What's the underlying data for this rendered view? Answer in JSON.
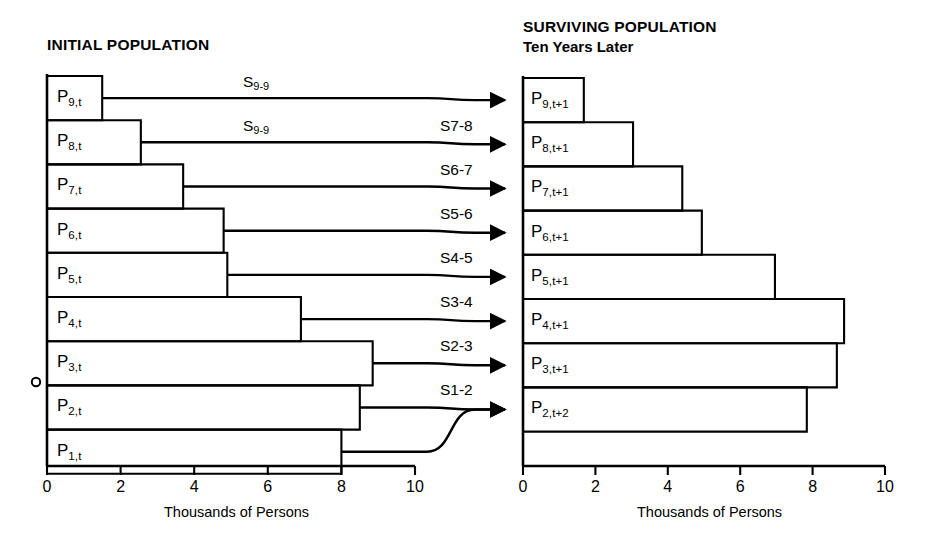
{
  "figure": {
    "type": "diagram"
  },
  "left_panel": {
    "title": "INITIAL POPULATION",
    "axis": {
      "label": "Thousands of Persons",
      "ticks": [
        "0",
        "2",
        "4",
        "6",
        "8",
        "10"
      ],
      "min": 0,
      "max": 10
    },
    "bars": [
      {
        "label_base": "P",
        "label_sub": "9,t",
        "value": 1.5
      },
      {
        "label_base": "P",
        "label_sub": "8,t",
        "value": 2.55
      },
      {
        "label_base": "P",
        "label_sub": "7,t",
        "value": 3.7
      },
      {
        "label_base": "P",
        "label_sub": "6,t",
        "value": 4.8
      },
      {
        "label_base": "P",
        "label_sub": "5,t",
        "value": 4.9
      },
      {
        "label_base": "P",
        "label_sub": "4,t",
        "value": 6.9
      },
      {
        "label_base": "P",
        "label_sub": "3,t",
        "value": 8.85
      },
      {
        "label_base": "P",
        "label_sub": "2,t",
        "value": 8.5
      },
      {
        "label_base": "P",
        "label_sub": "1,t",
        "value": 8.0
      }
    ]
  },
  "right_panel": {
    "title": "SURVIVING POPULATION",
    "subtitle": "Ten Years Later",
    "axis": {
      "label": "Thousands of Persons",
      "ticks": [
        "0",
        "2",
        "4",
        "6",
        "8",
        "10"
      ],
      "min": 0,
      "max": 10
    },
    "bars": [
      {
        "label_base": "P",
        "label_sub": "9,t+1",
        "value": 1.68
      },
      {
        "label_base": "P",
        "label_sub": "8,t+1",
        "value": 3.04
      },
      {
        "label_base": "P",
        "label_sub": "7,t+1",
        "value": 4.4
      },
      {
        "label_base": "P",
        "label_sub": "6,t+1",
        "value": 4.94
      },
      {
        "label_base": "P",
        "label_sub": "5,t+1",
        "value": 6.96
      },
      {
        "label_base": "P",
        "label_sub": "4,t+1",
        "value": 8.87
      },
      {
        "label_base": "P",
        "label_sub": "3,t+1",
        "value": 8.67
      },
      {
        "label_base": "P",
        "label_sub": "2,t+2",
        "value": 7.84
      }
    ]
  },
  "flows": [
    {
      "base": "S",
      "sub": "9-9",
      "sub_style": "subscript"
    },
    {
      "base": "S",
      "sub": "9-9",
      "sub_style": "subscript"
    },
    {
      "base": "S7-8",
      "sub": "",
      "sub_style": "inline"
    },
    {
      "base": "S6-7",
      "sub": "",
      "sub_style": "inline"
    },
    {
      "base": "S5-6",
      "sub": "",
      "sub_style": "inline"
    },
    {
      "base": "S4-5",
      "sub": "",
      "sub_style": "inline"
    },
    {
      "base": "S3-4",
      "sub": "",
      "sub_style": "inline"
    },
    {
      "base": "S2-3",
      "sub": "",
      "sub_style": "inline"
    },
    {
      "base": "S1-2",
      "sub": "",
      "sub_style": "inline"
    }
  ],
  "style": {
    "ink": "#000000",
    "paper": "#ffffff"
  }
}
